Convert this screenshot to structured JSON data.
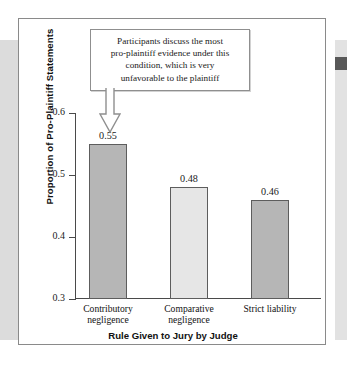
{
  "figure": {
    "callout": {
      "lines": [
        "Participants discuss the most",
        "pro-plaintiff evidence under this",
        "condition, which is very",
        "unfavorable to the plaintiff"
      ],
      "arrow_icon": "down-arrow-icon"
    },
    "colors": {
      "bar_dark": "#b6b6b6",
      "bar_light": "#e6e6e6",
      "bar_stroke": "#5d5d5d",
      "axis": "#4a4a4a",
      "frame": "#8a8a8a",
      "text": "#1a1a1a",
      "edge_band": "#dcdcdc",
      "edge_tab": "#585858"
    }
  },
  "chart_data": {
    "type": "bar",
    "title": "",
    "xlabel": "Rule Given to Jury by Judge",
    "ylabel": "Proportion of Pro-Plaintiff Statements",
    "categories": [
      "Contributory negligence",
      "Comparative negligence",
      "Strict liability"
    ],
    "category_lines": [
      [
        "Contributory",
        "negligence"
      ],
      [
        "Comparative",
        "negligence"
      ],
      [
        "Strict liability"
      ]
    ],
    "values": [
      0.55,
      0.48,
      0.46
    ],
    "value_labels": [
      "0.55",
      "0.48",
      "0.46"
    ],
    "bar_fills": [
      "#b6b6b6",
      "#e6e6e6",
      "#b6b6b6"
    ],
    "ylim": [
      0.3,
      0.6
    ],
    "yticks": [
      0.3,
      0.4,
      0.5,
      0.6
    ],
    "ytick_labels": [
      "0.3",
      "0.4",
      "0.5",
      "0.6"
    ],
    "grid": false,
    "legend": false,
    "annotation": "Participants discuss the most pro-plaintiff evidence under this condition, which is very unfavorable to the plaintiff",
    "annotation_target_category": "Contributory negligence"
  }
}
